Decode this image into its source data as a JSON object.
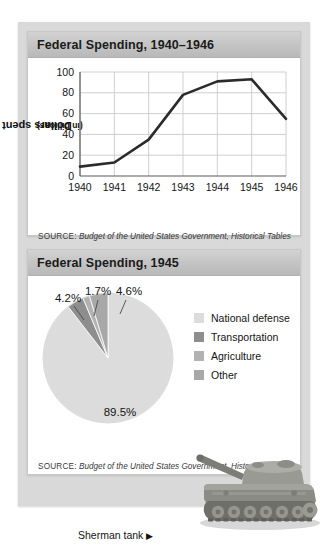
{
  "page": {
    "background": "#ffffff",
    "panel_color": "#d9d9d9"
  },
  "line_panel": {
    "title": "Federal Spending, 1940–1946",
    "source_label": "SOURCE:",
    "source_text": "Budget of the United States Government, Historical Tables"
  },
  "pie_panel": {
    "title": "Federal Spending, 1945",
    "source_label": "SOURCE:",
    "source_text": "Budget of the United States Government, Historical Tables"
  },
  "photo": {
    "caption": "Sherman tank",
    "arrow": "▶",
    "alt": "sherman-tank-photograph"
  },
  "chart_data": [
    {
      "type": "line",
      "title": "Federal Spending, 1940–1946",
      "xlabel": "",
      "ylabel": "Dollars spent",
      "ylabel_sub": "(in billions)",
      "categories": [
        "1940",
        "1941",
        "1942",
        "1943",
        "1944",
        "1945",
        "1946"
      ],
      "values": [
        9,
        13,
        35,
        78,
        91,
        93,
        55
      ],
      "ylim": [
        0,
        100
      ],
      "yticks": [
        0,
        20,
        40,
        60,
        80,
        100
      ],
      "grid": true,
      "legend": "none",
      "line_color": "#2b2b2b",
      "grid_color": "#c9c9c9"
    },
    {
      "type": "pie",
      "title": "Federal Spending, 1945",
      "labels": [
        "National defense",
        "Transportation",
        "Agriculture",
        "Other"
      ],
      "values": [
        89.5,
        4.2,
        1.7,
        4.6
      ],
      "value_labels": [
        "89.5%",
        "4.2%",
        "1.7%",
        "4.6%"
      ],
      "colors": [
        "#dcdcdc",
        "#8e8e8e",
        "#b2b2b2",
        "#a8a8a8"
      ],
      "legend": "right"
    }
  ]
}
